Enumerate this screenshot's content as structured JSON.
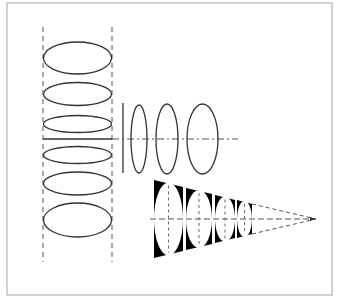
{
  "diagram": {
    "colors": {
      "background": "#ffffff",
      "frame": "#b4b4b4",
      "stroke": "#333333",
      "dash": "#555555",
      "fill_dark": "#000000"
    },
    "frame": {
      "x": 7,
      "y": 3,
      "w": 325,
      "h": 292
    },
    "left_stack": {
      "guide_x": [
        43,
        112
      ],
      "guide_y": [
        27,
        262
      ],
      "cx": 77.5,
      "rx": 34,
      "ellipses": [
        {
          "cy": 58,
          "ry": 16
        },
        {
          "cy": 94,
          "ry": 11.5
        },
        {
          "cy": 124,
          "ry": 8.5
        },
        {
          "cy": 155,
          "ry": 8.5
        },
        {
          "cy": 183.5,
          "ry": 11.5
        },
        {
          "cy": 220,
          "ry": 17
        }
      ],
      "horizontal_line_y": 139
    },
    "middle_group": {
      "axis": {
        "x1": 112,
        "x2": 238,
        "y": 139
      },
      "plane_line": {
        "x": 123,
        "y1": 103,
        "y2": 173
      },
      "ellipses": [
        {
          "cx": 139,
          "cy": 139,
          "rx": 8,
          "ry": 34
        },
        {
          "cx": 167,
          "cy": 139,
          "rx": 11,
          "ry": 35
        },
        {
          "cx": 202.5,
          "cy": 139,
          "rx": 15.5,
          "ry": 35
        }
      ]
    },
    "cone": {
      "apex": {
        "x": 316,
        "y": 219
      },
      "axis_start_x": 150,
      "segments": [
        {
          "x1": 154,
          "x2": 183,
          "top1": 180,
          "top2": 187
        },
        {
          "x1": 186,
          "x2": 212,
          "top1": 188,
          "top2": 194
        },
        {
          "x1": 215,
          "x2": 235,
          "top1": 195,
          "top2": 200
        },
        {
          "x1": 237,
          "x2": 252,
          "top1": 200,
          "top2": 204
        }
      ]
    }
  }
}
